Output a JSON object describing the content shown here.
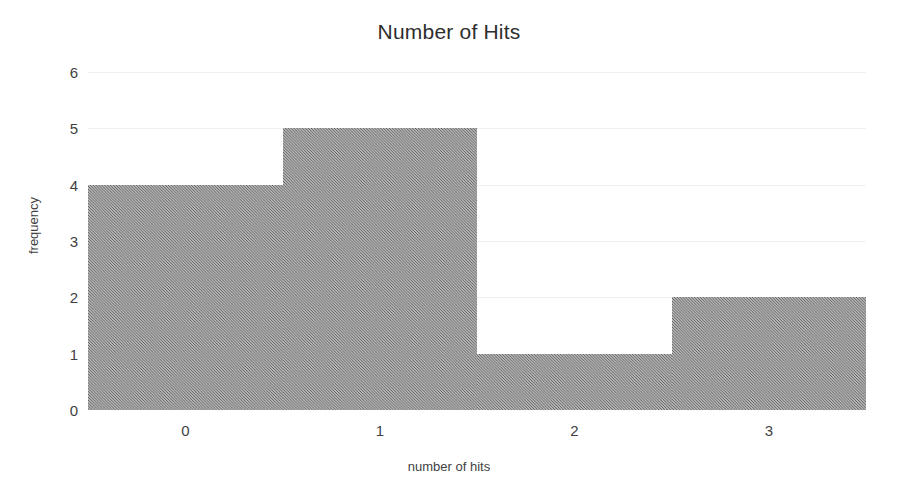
{
  "chart_data": {
    "type": "bar",
    "title": "Number of Hits",
    "xlabel": "number of hits",
    "ylabel": "frequency",
    "categories": [
      "0",
      "1",
      "2",
      "3"
    ],
    "values": [
      4,
      5,
      1,
      2
    ],
    "bin_edges": [
      -0.5,
      0.5,
      1.5,
      2.5,
      3.5
    ],
    "xticks": [
      "0",
      "1",
      "2",
      "3"
    ],
    "yticks": [
      "0",
      "1",
      "2",
      "3",
      "4",
      "5",
      "6"
    ],
    "xlim": [
      -0.5,
      3.5
    ],
    "ylim": [
      0,
      6
    ],
    "grid": true,
    "legend": "none",
    "bar_color": "#8a8a8a",
    "grid_color": "#f0f0f0",
    "background_color": "#ffffff",
    "text_color": "#3f3f3f"
  }
}
